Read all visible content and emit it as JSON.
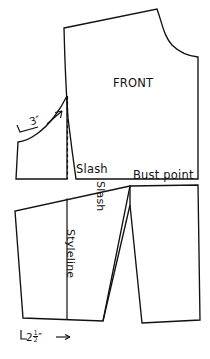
{
  "figure": {
    "type": "sewing-pattern-draft",
    "background_color": "#ffffff",
    "line_color": "#111111"
  },
  "labels": {
    "front": "FRONT",
    "slash_top": "Slash",
    "slash_vertical": "Slash",
    "bust_point": "Bust point",
    "styleline": "Styleline",
    "measure_three": "3",
    "measure_three_unit": "″",
    "measure_two_half_whole": "2",
    "measure_two_half_num": "1",
    "measure_two_half_den": "2",
    "measure_two_half_unit": "″",
    "bracket_left": "└",
    "arrow_right": "→"
  },
  "shapes": {
    "upper_bodice": {
      "name": "front-bodice-upper",
      "description": "Main front bodice piece with neckline curve, shoulder, armhole and side seam"
    },
    "left_underarm_panel": {
      "name": "left-underarm-panel",
      "description": "Small panel left of the dashed slash line under the armhole curve"
    },
    "lower_left_panel": {
      "name": "lower-left-panel",
      "description": "Lower left pattern piece divided by the styleline"
    },
    "lower_right_panel": {
      "name": "lower-right-panel",
      "description": "Lower right pattern piece with dart opening at bust point"
    },
    "dashed_slash_line": {
      "name": "dashed-slash-line",
      "description": "Vertical dashed construction line beneath the armhole"
    },
    "styleline_divider": {
      "name": "styleline-divider",
      "description": "Vertical line splitting the lower left panel"
    }
  },
  "annotations": {
    "three_inch_arrow": "arrow pointing up-right along armhole curve",
    "two_half_inch_arrow": "arrow pointing right along bottom hem measurement"
  }
}
